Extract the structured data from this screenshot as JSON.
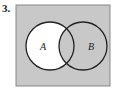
{
  "problem_number": "3.",
  "diagram": {
    "type": "venn",
    "universe_fill": "#c8c8c8",
    "shaded_region_fill": "#ffffff",
    "shaded_region": "A minus B",
    "sets": [
      {
        "label": "A"
      },
      {
        "label": "B"
      }
    ]
  }
}
